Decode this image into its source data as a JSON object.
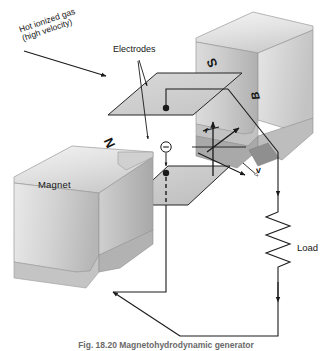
{
  "figure": {
    "caption": "Fig. 18.20   Magnetohydrodynamic generator"
  },
  "labels": {
    "gas_line1": "Hot ionized gas",
    "gas_line2": "(high velocity)",
    "electrodes": "Electrodes",
    "magnet": "Magnet",
    "load": "Load",
    "north_pole": "N",
    "south_pole": "S",
    "field_vector": "B",
    "velocity_vector": "v",
    "force_vector": "f"
  },
  "colors": {
    "stroke": "#1a1a1a",
    "magnet_light": "#ececec",
    "magnet_mid": "#d6d6d6",
    "magnet_dark": "#b4b4b4",
    "magnet_shadow": "#9a9a9a",
    "plate_fill": "#d2d2d2",
    "plate_fill_dark": "#bdbdbd",
    "wire": "#1a1a1a",
    "background": "#ffffff"
  },
  "components": [
    {
      "name": "upper-magnet-pole",
      "label": "S"
    },
    {
      "name": "lower-magnet-pole",
      "label": "N"
    },
    {
      "name": "upper-electrode-plate",
      "label": ""
    },
    {
      "name": "lower-electrode-plate",
      "label": ""
    },
    {
      "name": "electron-charge-marker",
      "label": "−"
    },
    {
      "name": "load-resistor",
      "label": "Load"
    },
    {
      "name": "external-circuit",
      "label": ""
    }
  ]
}
